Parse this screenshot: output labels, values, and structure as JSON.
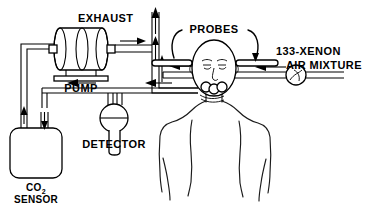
{
  "figure": {
    "background_color": "#ffffff",
    "line_color": "#000000",
    "width": 382,
    "height": 209
  },
  "labels": {
    "exhaust": "EXHAUST",
    "pump": "PUMP",
    "probes": "PROBES",
    "xenon_line1": "133-XENON",
    "xenon_line2": "AIR MIXTURE",
    "detector": "DETECTOR",
    "co2_line1": "CO",
    "co2_subscript": "2",
    "co2_line2": "SENSOR"
  },
  "components": [
    {
      "id": "pump",
      "name": "pump",
      "label": "PUMP",
      "shape": "double-cylinder-on-base"
    },
    {
      "id": "exhaust-stack",
      "name": "exhaust-stack",
      "label": "EXHAUST",
      "shape": "vertical-pipe-with-up-arrows"
    },
    {
      "id": "co2-sensor",
      "name": "co2-sensor",
      "label": "CO2 SENSOR",
      "shape": "canister"
    },
    {
      "id": "detector",
      "name": "detector",
      "label": "DETECTOR",
      "shape": "circle-with-stem"
    },
    {
      "id": "probes",
      "name": "probes",
      "label": "PROBES",
      "shape": "horizontal-rods-at-head"
    },
    {
      "id": "xenon-supply",
      "name": "xenon-supply",
      "label": "133-XENON AIR MIXTURE",
      "shape": "dual-line-with-valve"
    },
    {
      "id": "patient",
      "name": "patient",
      "label": "",
      "shape": "head-and-torso-outline"
    },
    {
      "id": "mouthpiece",
      "name": "mouthpiece",
      "label": "",
      "shape": "mouth-connector"
    }
  ],
  "flow_arrows": [
    {
      "name": "arrow-pump-outlet",
      "direction": "right"
    },
    {
      "name": "arrow-exhaust-upper",
      "direction": "up"
    },
    {
      "name": "arrow-exhaust-lower",
      "direction": "up"
    },
    {
      "name": "arrow-exhaust-top",
      "direction": "up"
    },
    {
      "name": "arrow-inhale-to-patient",
      "direction": "left"
    },
    {
      "name": "arrow-xenon-inlet",
      "direction": "left"
    },
    {
      "name": "arrow-exhale-from-patient",
      "direction": "left"
    },
    {
      "name": "arrow-to-detector",
      "direction": "left"
    },
    {
      "name": "arrow-into-co2-sensor",
      "direction": "down"
    },
    {
      "name": "arrow-out-of-co2-sensor",
      "direction": "up"
    }
  ]
}
